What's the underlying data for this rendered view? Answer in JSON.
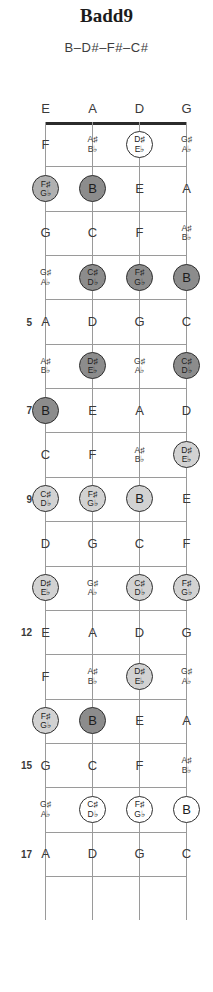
{
  "title": "Badd9",
  "spelling": "B–D#–F#–C#",
  "instrument": "bass-4-string",
  "strings": [
    "E",
    "A",
    "D",
    "G"
  ],
  "fret_numbers": [
    "5",
    "7",
    "9",
    "12",
    "15",
    "17"
  ],
  "colors": {
    "root": "#8c8c8c",
    "mid": "#b0b0b0",
    "lite": "#d2d2d2",
    "open": "#ffffff",
    "outline": "#2e2e2e",
    "grid": "#9a9a9a",
    "nut": "#2b2b2b",
    "text": "#3a3a3a"
  },
  "chord_tones": [
    "B",
    "D#/Eb",
    "F#/Gb",
    "C#/Db"
  ],
  "fretboard": [
    {
      "fret": 0,
      "label": "",
      "notes": [
        {
          "string": "E",
          "name": "E",
          "acc": "",
          "marked": false,
          "shade": ""
        },
        {
          "string": "A",
          "name": "A",
          "acc": "",
          "marked": false,
          "shade": ""
        },
        {
          "string": "D",
          "name": "D",
          "acc": "",
          "marked": false,
          "shade": ""
        },
        {
          "string": "G",
          "name": "G",
          "acc": "",
          "marked": false,
          "shade": ""
        }
      ]
    },
    {
      "fret": 1,
      "label": "",
      "notes": [
        {
          "string": "E",
          "name": "F",
          "acc": "",
          "marked": false,
          "shade": ""
        },
        {
          "string": "A",
          "name": "A♯",
          "acc": "B♭",
          "marked": false,
          "shade": ""
        },
        {
          "string": "D",
          "name": "D♯",
          "acc": "E♭",
          "marked": true,
          "shade": "open"
        },
        {
          "string": "G",
          "name": "G♯",
          "acc": "A♭",
          "marked": false,
          "shade": ""
        }
      ]
    },
    {
      "fret": 2,
      "label": "",
      "notes": [
        {
          "string": "E",
          "name": "F♯",
          "acc": "G♭",
          "marked": true,
          "shade": "mid"
        },
        {
          "string": "A",
          "name": "B",
          "acc": "",
          "marked": true,
          "shade": "root"
        },
        {
          "string": "D",
          "name": "E",
          "acc": "",
          "marked": false,
          "shade": ""
        },
        {
          "string": "G",
          "name": "A",
          "acc": "",
          "marked": false,
          "shade": ""
        }
      ]
    },
    {
      "fret": 3,
      "label": "",
      "notes": [
        {
          "string": "E",
          "name": "G",
          "acc": "",
          "marked": false,
          "shade": ""
        },
        {
          "string": "A",
          "name": "C",
          "acc": "",
          "marked": false,
          "shade": ""
        },
        {
          "string": "D",
          "name": "F",
          "acc": "",
          "marked": false,
          "shade": ""
        },
        {
          "string": "G",
          "name": "A♯",
          "acc": "B♭",
          "marked": false,
          "shade": ""
        }
      ]
    },
    {
      "fret": 4,
      "label": "",
      "notes": [
        {
          "string": "E",
          "name": "G♯",
          "acc": "A♭",
          "marked": false,
          "shade": ""
        },
        {
          "string": "A",
          "name": "C♯",
          "acc": "D♭",
          "marked": true,
          "shade": "root"
        },
        {
          "string": "D",
          "name": "F♯",
          "acc": "G♭",
          "marked": true,
          "shade": "root"
        },
        {
          "string": "G",
          "name": "B",
          "acc": "",
          "marked": true,
          "shade": "root"
        }
      ]
    },
    {
      "fret": 5,
      "label": "5",
      "notes": [
        {
          "string": "E",
          "name": "A",
          "acc": "",
          "marked": false,
          "shade": ""
        },
        {
          "string": "A",
          "name": "D",
          "acc": "",
          "marked": false,
          "shade": ""
        },
        {
          "string": "D",
          "name": "G",
          "acc": "",
          "marked": false,
          "shade": ""
        },
        {
          "string": "G",
          "name": "C",
          "acc": "",
          "marked": false,
          "shade": ""
        }
      ]
    },
    {
      "fret": 6,
      "label": "",
      "notes": [
        {
          "string": "E",
          "name": "A♯",
          "acc": "B♭",
          "marked": false,
          "shade": ""
        },
        {
          "string": "A",
          "name": "D♯",
          "acc": "E♭",
          "marked": true,
          "shade": "root"
        },
        {
          "string": "D",
          "name": "G♯",
          "acc": "A♭",
          "marked": false,
          "shade": ""
        },
        {
          "string": "G",
          "name": "C♯",
          "acc": "D♭",
          "marked": true,
          "shade": "root"
        }
      ]
    },
    {
      "fret": 7,
      "label": "7",
      "notes": [
        {
          "string": "E",
          "name": "B",
          "acc": "",
          "marked": true,
          "shade": "root"
        },
        {
          "string": "A",
          "name": "E",
          "acc": "",
          "marked": false,
          "shade": ""
        },
        {
          "string": "D",
          "name": "A",
          "acc": "",
          "marked": false,
          "shade": ""
        },
        {
          "string": "G",
          "name": "D",
          "acc": "",
          "marked": false,
          "shade": ""
        }
      ]
    },
    {
      "fret": 8,
      "label": "",
      "notes": [
        {
          "string": "E",
          "name": "C",
          "acc": "",
          "marked": false,
          "shade": ""
        },
        {
          "string": "A",
          "name": "F",
          "acc": "",
          "marked": false,
          "shade": ""
        },
        {
          "string": "D",
          "name": "A♯",
          "acc": "B♭",
          "marked": false,
          "shade": ""
        },
        {
          "string": "G",
          "name": "D♯",
          "acc": "E♭",
          "marked": true,
          "shade": "lite"
        }
      ]
    },
    {
      "fret": 9,
      "label": "9",
      "notes": [
        {
          "string": "E",
          "name": "C♯",
          "acc": "D♭",
          "marked": true,
          "shade": "lite"
        },
        {
          "string": "A",
          "name": "F♯",
          "acc": "G♭",
          "marked": true,
          "shade": "lite"
        },
        {
          "string": "D",
          "name": "B",
          "acc": "",
          "marked": true,
          "shade": "lite"
        },
        {
          "string": "G",
          "name": "E",
          "acc": "",
          "marked": false,
          "shade": ""
        }
      ]
    },
    {
      "fret": 10,
      "label": "",
      "notes": [
        {
          "string": "E",
          "name": "D",
          "acc": "",
          "marked": false,
          "shade": ""
        },
        {
          "string": "A",
          "name": "G",
          "acc": "",
          "marked": false,
          "shade": ""
        },
        {
          "string": "D",
          "name": "C",
          "acc": "",
          "marked": false,
          "shade": ""
        },
        {
          "string": "G",
          "name": "F",
          "acc": "",
          "marked": false,
          "shade": ""
        }
      ]
    },
    {
      "fret": 11,
      "label": "",
      "notes": [
        {
          "string": "E",
          "name": "D♯",
          "acc": "E♭",
          "marked": true,
          "shade": "lite"
        },
        {
          "string": "A",
          "name": "G♯",
          "acc": "A♭",
          "marked": false,
          "shade": ""
        },
        {
          "string": "D",
          "name": "C♯",
          "acc": "D♭",
          "marked": true,
          "shade": "lite"
        },
        {
          "string": "G",
          "name": "F♯",
          "acc": "G♭",
          "marked": true,
          "shade": "lite"
        }
      ]
    },
    {
      "fret": 12,
      "label": "12",
      "notes": [
        {
          "string": "E",
          "name": "E",
          "acc": "",
          "marked": false,
          "shade": ""
        },
        {
          "string": "A",
          "name": "A",
          "acc": "",
          "marked": false,
          "shade": ""
        },
        {
          "string": "D",
          "name": "D",
          "acc": "",
          "marked": false,
          "shade": ""
        },
        {
          "string": "G",
          "name": "G",
          "acc": "",
          "marked": false,
          "shade": ""
        }
      ]
    },
    {
      "fret": 13,
      "label": "",
      "notes": [
        {
          "string": "E",
          "name": "F",
          "acc": "",
          "marked": false,
          "shade": ""
        },
        {
          "string": "A",
          "name": "A♯",
          "acc": "B♭",
          "marked": false,
          "shade": ""
        },
        {
          "string": "D",
          "name": "D♯",
          "acc": "E♭",
          "marked": true,
          "shade": "lite"
        },
        {
          "string": "G",
          "name": "G♯",
          "acc": "A♭",
          "marked": false,
          "shade": ""
        }
      ]
    },
    {
      "fret": 14,
      "label": "",
      "notes": [
        {
          "string": "E",
          "name": "F♯",
          "acc": "G♭",
          "marked": true,
          "shade": "lite"
        },
        {
          "string": "A",
          "name": "B",
          "acc": "",
          "marked": true,
          "shade": "root"
        },
        {
          "string": "D",
          "name": "E",
          "acc": "",
          "marked": false,
          "shade": ""
        },
        {
          "string": "G",
          "name": "A",
          "acc": "",
          "marked": false,
          "shade": ""
        }
      ]
    },
    {
      "fret": 15,
      "label": "15",
      "notes": [
        {
          "string": "E",
          "name": "G",
          "acc": "",
          "marked": false,
          "shade": ""
        },
        {
          "string": "A",
          "name": "C",
          "acc": "",
          "marked": false,
          "shade": ""
        },
        {
          "string": "D",
          "name": "F",
          "acc": "",
          "marked": false,
          "shade": ""
        },
        {
          "string": "G",
          "name": "A♯",
          "acc": "B♭",
          "marked": false,
          "shade": ""
        }
      ]
    },
    {
      "fret": 16,
      "label": "",
      "notes": [
        {
          "string": "E",
          "name": "G♯",
          "acc": "A♭",
          "marked": false,
          "shade": ""
        },
        {
          "string": "A",
          "name": "C♯",
          "acc": "D♭",
          "marked": true,
          "shade": "open"
        },
        {
          "string": "D",
          "name": "F♯",
          "acc": "G♭",
          "marked": true,
          "shade": "open"
        },
        {
          "string": "G",
          "name": "B",
          "acc": "",
          "marked": true,
          "shade": "open"
        }
      ]
    },
    {
      "fret": 17,
      "label": "17",
      "notes": [
        {
          "string": "E",
          "name": "A",
          "acc": "",
          "marked": false,
          "shade": ""
        },
        {
          "string": "A",
          "name": "D",
          "acc": "",
          "marked": false,
          "shade": ""
        },
        {
          "string": "D",
          "name": "G",
          "acc": "",
          "marked": false,
          "shade": ""
        },
        {
          "string": "G",
          "name": "C",
          "acc": "",
          "marked": false,
          "shade": ""
        }
      ]
    }
  ]
}
